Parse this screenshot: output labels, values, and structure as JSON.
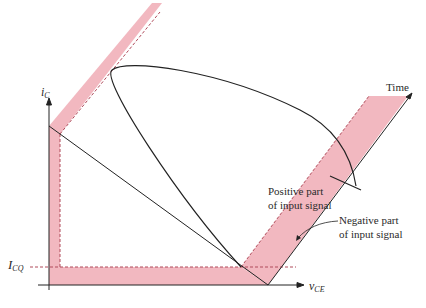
{
  "diagram": {
    "type": "transistor-load-line-waveform",
    "top_clipped_text": "pp          g",
    "axes": {
      "y_label": "i",
      "y_label_sub": "C",
      "x_label": "v",
      "x_label_sub": "CE",
      "quiescent_label": "I",
      "quiescent_label_sub": "CQ"
    },
    "labels": {
      "time": "Time",
      "positive_line1": "Positive part",
      "positive_line2": "of input signal",
      "negative_line1": "Negative part",
      "negative_line2": "of input signal"
    },
    "colors": {
      "band_fill": "#f2b8c0",
      "band_edge": "#d98a96",
      "line": "#222222",
      "dash": "#b04a5a"
    }
  }
}
